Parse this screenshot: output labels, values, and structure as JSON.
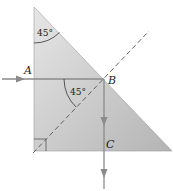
{
  "diagram": {
    "type": "prism-ray-diagram",
    "prism": {
      "shape": "right-isosceles-triangle",
      "fill_light": "#e6e6e6",
      "fill_dark": "#b4b4b4"
    },
    "points": {
      "A": "A",
      "B": "B",
      "C": "C"
    },
    "angles": {
      "apex": "45°",
      "incidence_at_B": "45°"
    },
    "markers": {
      "right_angle": "bottom-left corner",
      "normal_line": "dashed normal through B"
    },
    "rays": {
      "incident": "horizontal ray entering at A toward B",
      "reflected": "vertical ray from B downward through C"
    },
    "colors": {
      "ray": "#8a8a8a",
      "dashed": "#555555",
      "text": "#222222"
    }
  }
}
